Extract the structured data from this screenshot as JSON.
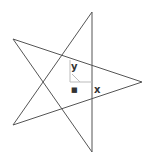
{
  "diagram": {
    "type": "pentagram",
    "vertices": {
      "top": [
        92,
        12
      ],
      "left_upper": [
        13,
        39
      ],
      "right": [
        142,
        82
      ],
      "left_lower": [
        13,
        125
      ],
      "bottom": [
        92,
        152
      ]
    },
    "line_color": "#555555",
    "axis_color": "#bbbbbb",
    "labels": {
      "y": "y",
      "x": "x",
      "origin_marker": "■"
    }
  }
}
